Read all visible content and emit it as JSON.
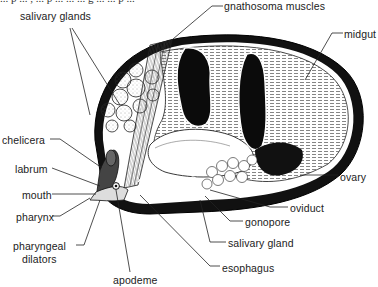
{
  "figure": {
    "top_cut_text": "... p ... , ... p ... ... ... g ... ... p ...",
    "labels": [
      {
        "id": "salivary-glands",
        "text": "salivary glands",
        "x": 32,
        "y": 14
      },
      {
        "id": "gnathosoma-muscles",
        "text": "gnathosoma muscles",
        "x": 223,
        "y": 1
      },
      {
        "id": "midgut",
        "text": "midgut",
        "x": 344,
        "y": 29
      },
      {
        "id": "chelicera",
        "text": "chelicera",
        "x": 2,
        "y": 135
      },
      {
        "id": "labrum",
        "text": "labrum",
        "x": 15,
        "y": 164
      },
      {
        "id": "mouth",
        "text": "mouth",
        "x": 22,
        "y": 190
      },
      {
        "id": "pharynx",
        "text": "pharynx",
        "x": 16,
        "y": 212
      },
      {
        "id": "pharyngeal-dilators",
        "text": "pharyngeal",
        "text2": "dilators",
        "x": 13,
        "y": 240
      },
      {
        "id": "apodeme",
        "text": "apodeme",
        "x": 113,
        "y": 275
      },
      {
        "id": "ovary",
        "text": "ovary",
        "x": 340,
        "y": 172
      },
      {
        "id": "oviduct",
        "text": "oviduct",
        "x": 290,
        "y": 203
      },
      {
        "id": "gonopore",
        "text": "gonopore",
        "x": 245,
        "y": 217
      },
      {
        "id": "salivary-gland",
        "text": "salivary gland",
        "x": 228,
        "y": 238
      },
      {
        "id": "esophagus",
        "text": "esophagus",
        "x": 222,
        "y": 263
      }
    ]
  },
  "colors": {
    "ink": "#111111",
    "paper": "#ffffff",
    "label": "#222222"
  }
}
